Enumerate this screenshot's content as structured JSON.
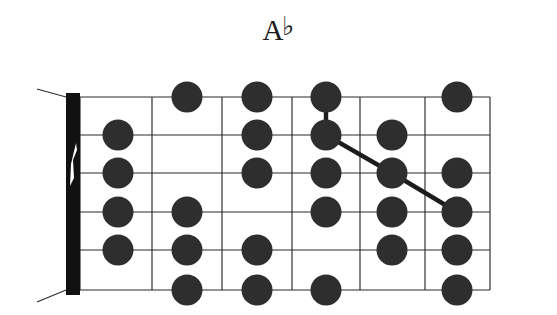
{
  "title": {
    "full": "A♭",
    "note_letter": "A",
    "accidental": "♭",
    "accidental_name": "flat"
  },
  "diagram": {
    "type": "guitar-fretboard-scale-diagram",
    "instrument": "guitar",
    "orientation": "horizontal",
    "string_count": 6,
    "fret_count": 6,
    "nut_shown": true,
    "starting_fret_label": "",
    "dot_color": "#2e2e2e",
    "line_color": "#2b2b2b",
    "nut_color": "#111111",
    "background_color": "#ffffff",
    "geometry": {
      "left": 80,
      "right": 490,
      "top": 97,
      "bottom": 290,
      "nut_left": 66,
      "nut_right": 80,
      "string_y": [
        97,
        135,
        173,
        212,
        250,
        290
      ],
      "fret_x": [
        80,
        152,
        222,
        292,
        360,
        425,
        490
      ],
      "fret_center_x": [
        118,
        187,
        257,
        326,
        392,
        457
      ],
      "dot_radius": 15.5
    },
    "notes": [
      {
        "string": 2,
        "fret": 1
      },
      {
        "string": 3,
        "fret": 1
      },
      {
        "string": 4,
        "fret": 1
      },
      {
        "string": 5,
        "fret": 1
      },
      {
        "string": 1,
        "fret": 2
      },
      {
        "string": 4,
        "fret": 2
      },
      {
        "string": 5,
        "fret": 2
      },
      {
        "string": 6,
        "fret": 2
      },
      {
        "string": 1,
        "fret": 3
      },
      {
        "string": 2,
        "fret": 3
      },
      {
        "string": 3,
        "fret": 3
      },
      {
        "string": 5,
        "fret": 3
      },
      {
        "string": 6,
        "fret": 3
      },
      {
        "string": 1,
        "fret": 4
      },
      {
        "string": 2,
        "fret": 4
      },
      {
        "string": 3,
        "fret": 4
      },
      {
        "string": 4,
        "fret": 4
      },
      {
        "string": 6,
        "fret": 4
      },
      {
        "string": 2,
        "fret": 5
      },
      {
        "string": 3,
        "fret": 5
      },
      {
        "string": 4,
        "fret": 5
      },
      {
        "string": 5,
        "fret": 5
      },
      {
        "string": 1,
        "fret": 6
      },
      {
        "string": 3,
        "fret": 6
      },
      {
        "string": 4,
        "fret": 6
      },
      {
        "string": 5,
        "fret": 6
      },
      {
        "string": 6,
        "fret": 6
      }
    ],
    "connector_path": [
      {
        "string": 1,
        "fret": 4
      },
      {
        "string": 2,
        "fret": 4
      },
      {
        "string": 3,
        "fret": 5
      },
      {
        "string": 4,
        "fret": 6
      }
    ]
  }
}
